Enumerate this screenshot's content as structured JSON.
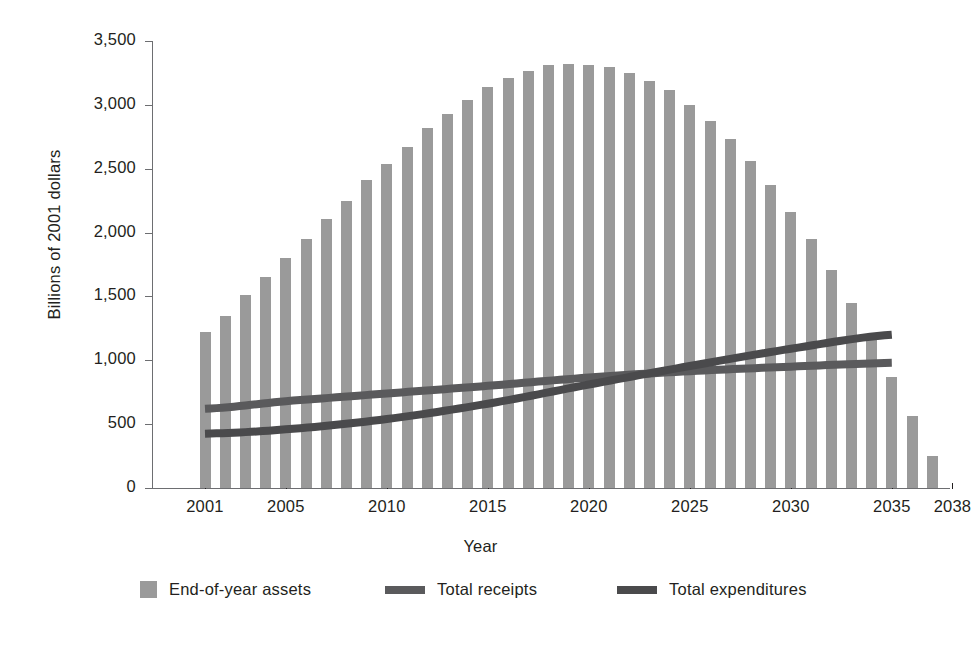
{
  "chart_data": {
    "type": "bar",
    "title": "",
    "xlabel": "Year",
    "ylabel": "Billions of 2001 dollars",
    "ylim": [
      0,
      3500
    ],
    "xlim": [
      2000,
      2039
    ],
    "grid": false,
    "legend_position": "bottom",
    "y_ticks": [
      0,
      500,
      1000,
      1500,
      2000,
      2500,
      3000,
      3500
    ],
    "y_tick_labels": [
      "0",
      "500",
      "1,000",
      "1,500",
      "2,000",
      "2,500",
      "3,000",
      "3,500"
    ],
    "x_ticks": [
      2001,
      2005,
      2010,
      2015,
      2020,
      2025,
      2030,
      2035,
      2038
    ],
    "x_tick_labels": [
      "2001",
      "2005",
      "2010",
      "2015",
      "2020",
      "2025",
      "2030",
      "2035",
      "2038"
    ],
    "x": [
      2001,
      2002,
      2003,
      2004,
      2005,
      2006,
      2007,
      2008,
      2009,
      2010,
      2011,
      2012,
      2013,
      2014,
      2015,
      2016,
      2017,
      2018,
      2019,
      2020,
      2021,
      2022,
      2023,
      2024,
      2025,
      2026,
      2027,
      2028,
      2029,
      2030,
      2031,
      2032,
      2033,
      2034,
      2035,
      2036,
      2037,
      2038
    ],
    "series": [
      {
        "name": "End-of-year assets",
        "type": "bar",
        "color": "#9a9a9a",
        "values": [
          1220,
          1350,
          1510,
          1650,
          1800,
          1950,
          2110,
          2250,
          2410,
          2540,
          2670,
          2820,
          2930,
          3040,
          3140,
          3210,
          3265,
          3310,
          3320,
          3315,
          3300,
          3250,
          3190,
          3115,
          3000,
          2870,
          2730,
          2560,
          2370,
          2160,
          1950,
          1705,
          1450,
          1175,
          870,
          565,
          250,
          0
        ]
      },
      {
        "name": "Total receipts",
        "type": "line",
        "color": "#5a5a5c",
        "x": [
          2001,
          2005,
          2010,
          2015,
          2020,
          2025,
          2030,
          2035
        ],
        "values": [
          620,
          680,
          740,
          800,
          865,
          915,
          950,
          980
        ]
      },
      {
        "name": "Total expenditures",
        "type": "line",
        "color": "#4a4a4c",
        "x": [
          2001,
          2005,
          2010,
          2015,
          2020,
          2025,
          2030,
          2035
        ],
        "values": [
          425,
          460,
          540,
          660,
          810,
          955,
          1090,
          1200
        ]
      }
    ],
    "annotations": []
  },
  "axes": {
    "x_title": "Year",
    "y_title": "Billions of 2001 dollars"
  },
  "legend": {
    "items": [
      {
        "label": "End-of-year assets",
        "marker": "square-swatch",
        "color": "#9a9a9a"
      },
      {
        "label": "Total receipts",
        "marker": "line-swatch",
        "color": "#5a5a5c"
      },
      {
        "label": "Total expenditures",
        "marker": "line-swatch",
        "color": "#4a4a4c"
      }
    ]
  }
}
